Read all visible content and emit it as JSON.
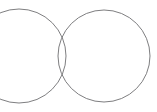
{
  "canvas": {
    "width": 157,
    "height": 112,
    "background_color": "#ffffff"
  },
  "diagram": {
    "type": "venn-two-set",
    "title": "",
    "stroke_color": "#6f6f72",
    "stroke_width": 0.9,
    "fill": "none",
    "shapes": [
      {
        "name": "left-circle",
        "cx": 19,
        "cy": 56,
        "r": 47,
        "clipped_at_left_edge": true
      },
      {
        "name": "right-circle",
        "cx": 104,
        "cy": 56,
        "r": 46,
        "clipped_at_left_edge": false
      }
    ],
    "intersection_points": [
      {
        "name": "upper-intersection",
        "x": 66,
        "y": 22
      },
      {
        "name": "lower-intersection",
        "x": 67,
        "y": 89
      }
    ],
    "regions": [
      {
        "name": "left-only-region",
        "label": ""
      },
      {
        "name": "overlap-region",
        "label": ""
      },
      {
        "name": "right-only-region",
        "label": ""
      }
    ]
  }
}
